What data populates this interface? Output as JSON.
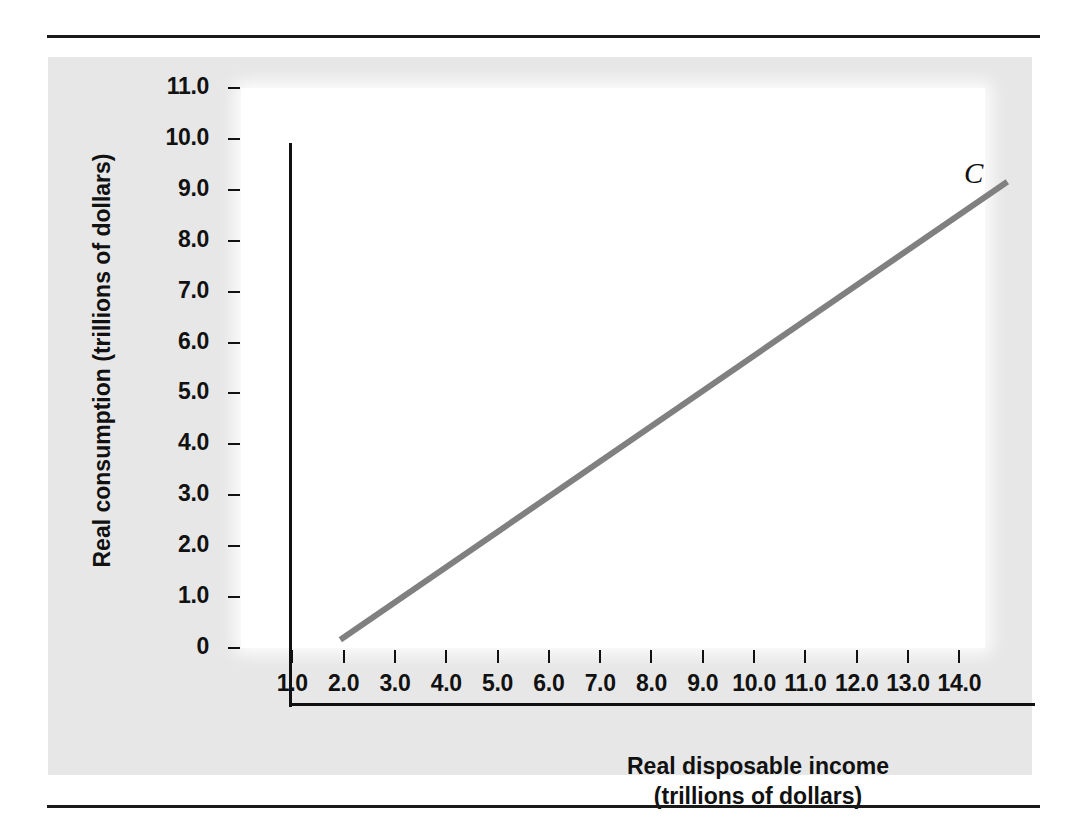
{
  "figure": {
    "panel_background": "#e7e7e7",
    "plot_background": "#ffffff",
    "rule_color": "#1a1a1a"
  },
  "chart_data": {
    "type": "line",
    "title": "",
    "xlabel_line1": "Real disposable income",
    "xlabel_line2": "(trillions of dollars)",
    "ylabel": "Real consumption (trillions of dollars)",
    "xlim": [
      0,
      14.5
    ],
    "ylim": [
      0,
      11.0
    ],
    "grid": false,
    "legend": "none",
    "x_ticks": [
      "1.0",
      "2.0",
      "3.0",
      "4.0",
      "5.0",
      "6.0",
      "7.0",
      "8.0",
      "9.0",
      "10.0",
      "11.0",
      "12.0",
      "13.0",
      "14.0"
    ],
    "x_tick_values": [
      1,
      2,
      3,
      4,
      5,
      6,
      7,
      8,
      9,
      10,
      11,
      12,
      13,
      14
    ],
    "y_ticks": [
      "0",
      "1.0",
      "2.0",
      "3.0",
      "4.0",
      "5.0",
      "6.0",
      "7.0",
      "8.0",
      "9.0",
      "10.0",
      "11.0"
    ],
    "y_tick_values": [
      0,
      1,
      2,
      3,
      4,
      5,
      6,
      7,
      8,
      9,
      10,
      11
    ],
    "series": [
      {
        "name": "C",
        "annotation": "C",
        "color": "#808080",
        "line_width": 6,
        "x": [
          1.0,
          14.0
        ],
        "y": [
          1.28,
          10.28
        ]
      }
    ]
  }
}
